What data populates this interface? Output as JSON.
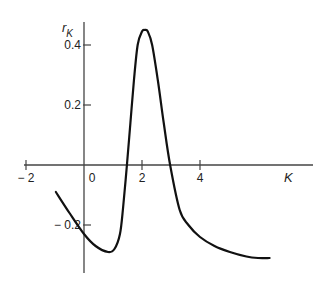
{
  "chart_data": {
    "type": "line",
    "title": "",
    "xlabel": "K",
    "ylabel": "r_K",
    "ylabel_main": "r",
    "ylabel_sub": "K",
    "xlim": [
      -2,
      7.7
    ],
    "ylim": [
      -0.36,
      0.5
    ],
    "grid": false,
    "legend": null,
    "x_ticks": [
      -2,
      0,
      2,
      4
    ],
    "x_tick_labels": [
      "− 2",
      "0",
      "2",
      "4"
    ],
    "y_ticks": [
      0.4,
      0.2,
      -0.2
    ],
    "y_tick_labels": [
      "0.4",
      "0.2",
      "− 0.2"
    ],
    "series": [
      {
        "name": "r_K",
        "x": [
          -0.97,
          -0.5,
          0.0,
          0.4,
          0.83,
          1.05,
          1.24,
          1.35,
          1.48,
          1.6,
          1.72,
          1.85,
          2.0,
          2.1,
          2.2,
          2.35,
          2.55,
          2.75,
          2.97,
          3.3,
          3.6,
          4.0,
          4.5,
          5.03,
          5.6,
          6.0,
          6.4
        ],
        "y": [
          -0.09,
          -0.16,
          -0.23,
          -0.27,
          -0.29,
          -0.28,
          -0.23,
          -0.14,
          0.0,
          0.14,
          0.28,
          0.4,
          0.445,
          0.45,
          0.445,
          0.4,
          0.28,
          0.14,
          0.0,
          -0.15,
          -0.2,
          -0.24,
          -0.27,
          -0.29,
          -0.305,
          -0.31,
          -0.31
        ]
      }
    ]
  }
}
